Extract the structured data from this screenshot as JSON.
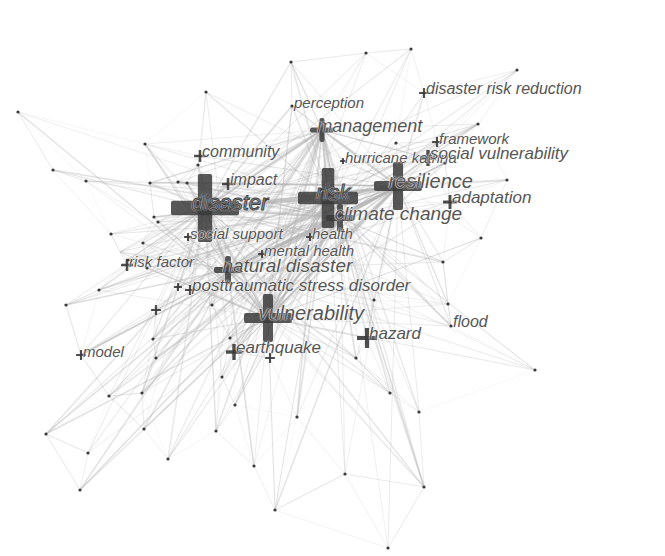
{
  "chart_data": {
    "type": "network",
    "title": "",
    "colors": {
      "background": "#ffffff",
      "node": "#3a3a3a",
      "edge": "#b0b0b0",
      "label": "#555555"
    },
    "keywords": [
      {
        "id": "disaster",
        "label": "disaster",
        "x": 205,
        "y": 208,
        "size": 34,
        "font": 22,
        "outlined": true
      },
      {
        "id": "risk",
        "label": "risk",
        "x": 328,
        "y": 198,
        "size": 30,
        "font": 22,
        "outlined": true
      },
      {
        "id": "resilience",
        "label": "resilience",
        "x": 398,
        "y": 186,
        "size": 24,
        "font": 20,
        "outlined": false
      },
      {
        "id": "climate-change",
        "label": "climate change",
        "x": 340,
        "y": 218,
        "size": 14,
        "font": 19,
        "outlined": false
      },
      {
        "id": "vulnerability",
        "label": "vulnerability",
        "x": 268,
        "y": 318,
        "size": 24,
        "font": 20,
        "outlined": false
      },
      {
        "id": "natural-disaster",
        "label": "natural disaster",
        "x": 228,
        "y": 270,
        "size": 14,
        "font": 19,
        "outlined": false
      },
      {
        "id": "management",
        "label": "management",
        "x": 322,
        "y": 130,
        "size": 12,
        "font": 18,
        "outlined": false
      },
      {
        "id": "impact",
        "label": "impact",
        "x": 228,
        "y": 184,
        "size": 6,
        "font": 16,
        "outlined": false
      },
      {
        "id": "community",
        "label": "community",
        "x": 200,
        "y": 156,
        "size": 6,
        "font": 16,
        "outlined": false
      },
      {
        "id": "hurricane-katrina",
        "label": "hurricane katrina",
        "x": 343,
        "y": 161,
        "size": 3,
        "font": 15,
        "outlined": false
      },
      {
        "id": "perception",
        "label": "perception",
        "x": 292,
        "y": 106,
        "size": 2,
        "font": 15,
        "outlined": false
      },
      {
        "id": "disaster-risk-reduction",
        "label": "disaster risk reduction",
        "x": 424,
        "y": 93,
        "size": 5,
        "font": 16,
        "outlined": false
      },
      {
        "id": "framework",
        "label": "framework",
        "x": 437,
        "y": 142,
        "size": 5,
        "font": 15,
        "outlined": false
      },
      {
        "id": "social-vulnerability",
        "label": "social vulnerability",
        "x": 428,
        "y": 158,
        "size": 8,
        "font": 17,
        "outlined": false
      },
      {
        "id": "adaptation",
        "label": "adaptation",
        "x": 450,
        "y": 202,
        "size": 7,
        "font": 17,
        "outlined": false
      },
      {
        "id": "social-support",
        "label": "social support",
        "x": 188,
        "y": 237,
        "size": 4,
        "font": 15,
        "outlined": false
      },
      {
        "id": "health",
        "label": "health",
        "x": 310,
        "y": 237,
        "size": 4,
        "font": 15,
        "outlined": false
      },
      {
        "id": "mental-health",
        "label": "mental health",
        "x": 262,
        "y": 254,
        "size": 4,
        "font": 15,
        "outlined": false
      },
      {
        "id": "risk-factor",
        "label": "risk factor",
        "x": 127,
        "y": 265,
        "size": 6,
        "font": 15,
        "outlined": false
      },
      {
        "id": "posttraumatic-stress-disorder",
        "label": "posttraumatic stress disorder",
        "x": 190,
        "y": 290,
        "size": 5,
        "font": 17,
        "outlined": false
      },
      {
        "id": "earthquake",
        "label": "earthquake",
        "x": 234,
        "y": 352,
        "size": 8,
        "font": 17,
        "outlined": false
      },
      {
        "id": "hazard",
        "label": "hazard",
        "x": 367,
        "y": 338,
        "size": 10,
        "font": 17,
        "outlined": false
      },
      {
        "id": "flood",
        "label": "flood",
        "x": 451,
        "y": 326,
        "size": 2,
        "font": 16,
        "outlined": false
      },
      {
        "id": "model",
        "label": "model",
        "x": 81,
        "y": 355,
        "size": 5,
        "font": 15,
        "outlined": false
      }
    ],
    "minor_crosses": [
      {
        "x": 270,
        "y": 358,
        "size": 5
      },
      {
        "x": 156,
        "y": 310,
        "size": 5
      },
      {
        "x": 178,
        "y": 287,
        "size": 4
      },
      {
        "x": 120,
        "y": 252,
        "size": 0
      }
    ],
    "unlabeled_nodes": [
      [
        366,
        53
      ],
      [
        411,
        49
      ],
      [
        517,
        70
      ],
      [
        18,
        112
      ],
      [
        206,
        92
      ],
      [
        53,
        170
      ],
      [
        86,
        181
      ],
      [
        145,
        144
      ],
      [
        150,
        183
      ],
      [
        187,
        183
      ],
      [
        154,
        217
      ],
      [
        158,
        222
      ],
      [
        111,
        234
      ],
      [
        143,
        243
      ],
      [
        198,
        165
      ],
      [
        178,
        182
      ],
      [
        198,
        203
      ],
      [
        128,
        260
      ],
      [
        147,
        268
      ],
      [
        99,
        290
      ],
      [
        66,
        305
      ],
      [
        153,
        339
      ],
      [
        156,
        358
      ],
      [
        109,
        396
      ],
      [
        142,
        393
      ],
      [
        46,
        434
      ],
      [
        88,
        453
      ],
      [
        144,
        429
      ],
      [
        80,
        490
      ],
      [
        168,
        459
      ],
      [
        216,
        431
      ],
      [
        222,
        377
      ],
      [
        235,
        405
      ],
      [
        254,
        466
      ],
      [
        297,
        417
      ],
      [
        275,
        510
      ],
      [
        388,
        548
      ],
      [
        356,
        358
      ],
      [
        390,
        393
      ],
      [
        419,
        412
      ],
      [
        345,
        474
      ],
      [
        424,
        487
      ],
      [
        535,
        370
      ],
      [
        481,
        238
      ],
      [
        443,
        262
      ],
      [
        448,
        304
      ],
      [
        374,
        300
      ],
      [
        478,
        124
      ],
      [
        445,
        163
      ],
      [
        507,
        180
      ],
      [
        396,
        143
      ],
      [
        291,
        62
      ],
      [
        190,
        262
      ],
      [
        212,
        305
      ],
      [
        230,
        338
      ]
    ],
    "edges_note": "Dense light-gray edges radiate from central hubs (disaster, risk, vulnerability, natural disaster) to peripheral nodes"
  }
}
